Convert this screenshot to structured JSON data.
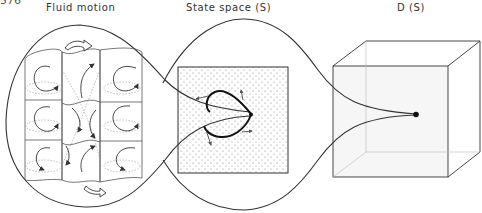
{
  "page_number": "576",
  "panels": [
    {
      "id": "fluid",
      "title": "Fluid motion",
      "x": 80
    },
    {
      "id": "state",
      "title": "State space (S)",
      "x": 232
    },
    {
      "id": "dspace",
      "title": "D (S)",
      "x": 412
    }
  ],
  "colors": {
    "stroke": "#2a2a2a",
    "light": "#9a9a9a",
    "dots": "#8a8a8a"
  }
}
